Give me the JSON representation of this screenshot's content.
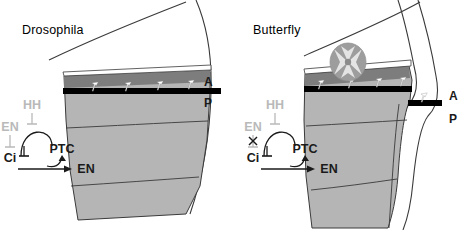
{
  "figure": {
    "background_color": "#ffffff",
    "panels": [
      {
        "id": "drosophila",
        "title": "Drosophila",
        "compartment_labels": {
          "anterior": "A",
          "posterior": "P"
        },
        "has_eyespot": false,
        "network": {
          "nodes": [
            {
              "id": "hh",
              "label": "HH",
              "state": "muted"
            },
            {
              "id": "en_top",
              "label": "EN",
              "state": "muted"
            },
            {
              "id": "ci",
              "label": "Ci",
              "state": "active"
            },
            {
              "id": "ptc",
              "label": "PTC",
              "state": "active"
            },
            {
              "id": "en_out",
              "label": "EN",
              "state": "active"
            }
          ],
          "edges": [
            {
              "from": "en_top",
              "to": "ci",
              "type": "repression"
            },
            {
              "from": "hh",
              "to": "ptc_loop",
              "type": "repression"
            },
            {
              "from": "ci",
              "to": "ptc",
              "type": "activation"
            },
            {
              "from": "ptc",
              "to": "ci",
              "type": "repression"
            },
            {
              "from": "ci",
              "to": "en_out",
              "type": "activation"
            }
          ],
          "blocked_edge": null
        }
      },
      {
        "id": "butterfly",
        "title": "Butterfly",
        "compartment_labels": {
          "anterior": "A",
          "posterior": "P"
        },
        "has_eyespot": true,
        "eyespot": {
          "name": "eyespot",
          "outer_color": "#9d9d9d",
          "inner_color": "#e8e8e8"
        },
        "network": {
          "nodes": [
            {
              "id": "hh",
              "label": "HH",
              "state": "muted"
            },
            {
              "id": "en_top",
              "label": "EN",
              "state": "muted"
            },
            {
              "id": "ci",
              "label": "Ci",
              "state": "active"
            },
            {
              "id": "ptc",
              "label": "PTC",
              "state": "active"
            },
            {
              "id": "en_out",
              "label": "EN",
              "state": "active"
            }
          ],
          "edges": [
            {
              "from": "en_top",
              "to": "ci",
              "type": "repression-blocked"
            },
            {
              "from": "hh",
              "to": "ptc_loop",
              "type": "repression"
            },
            {
              "from": "ci",
              "to": "ptc",
              "type": "activation"
            },
            {
              "from": "ptc",
              "to": "ci",
              "type": "repression"
            },
            {
              "from": "ci",
              "to": "en_out",
              "type": "activation"
            }
          ],
          "blocked_edge": {
            "symbol": "x",
            "name": "blocked-interaction-marker"
          }
        }
      }
    ],
    "colors": {
      "wing_fill": "#b5b5b5",
      "wing_dark_band": "#7d7d7d",
      "wing_black_band": "#000000",
      "outline": "#3a3a3a",
      "scale_marker": "#ffffff",
      "text_active": "#1a1a1a",
      "text_muted": "#b9b9b9",
      "eyespot_outer": "#9d9d9d",
      "eyespot_inner": "#e6e6e6"
    },
    "scale_markers": {
      "name": "wing-scale-bristle",
      "count_left": 4,
      "count_right": 5
    }
  }
}
